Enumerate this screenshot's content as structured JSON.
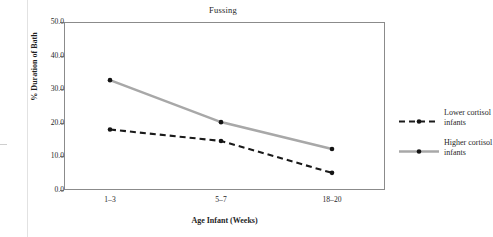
{
  "chart_data": {
    "type": "line",
    "title": "Fussing",
    "xlabel": "Age Infant (Weeks)",
    "ylabel": "% Duration of Bath",
    "categories": [
      "1–3",
      "5–7",
      "18–20"
    ],
    "ylim": [
      0.0,
      50.0
    ],
    "yticks": [
      "0.0",
      "10.0",
      "20.0",
      "30.0",
      "40.0",
      "50.0"
    ],
    "ytick_values": [
      0.0,
      10.0,
      20.0,
      30.0,
      40.0,
      50.0
    ],
    "grid": false,
    "legend_position": "right",
    "series": [
      {
        "name": "Lower cortisol infants",
        "values": [
          18.0,
          14.6,
          5.1
        ],
        "color": "#1a1a1a",
        "style": "dashed",
        "marker": "circle"
      },
      {
        "name": "Higher cortisol infants",
        "values": [
          32.7,
          20.2,
          12.2
        ],
        "color": "#a8a8a8",
        "style": "solid",
        "marker": "circle"
      }
    ]
  },
  "legend": {
    "entries": [
      {
        "label": "Lower cortisol infants"
      },
      {
        "label": "Higher cortisol infants"
      }
    ]
  },
  "colors": {
    "lower_series": "#1a1a1a",
    "higher_series": "#a8a8a8",
    "axis": "#8b8b8b",
    "text": "#1f1f1f"
  }
}
